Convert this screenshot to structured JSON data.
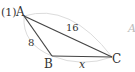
{
  "problem": {
    "number": "(1)"
  },
  "triangle": {
    "vertices": [
      {
        "name": "A",
        "x": 24,
        "y": 16
      },
      {
        "name": "B",
        "x": 52,
        "y": 56
      },
      {
        "name": "C",
        "x": 112,
        "y": 57
      }
    ],
    "sides": {
      "AB": "8",
      "AC": "16",
      "BC": "x"
    },
    "colors": {
      "line": "#444444",
      "arc": "#d9d9d9",
      "text": "#333333"
    }
  },
  "next_figure_fragment": "A"
}
